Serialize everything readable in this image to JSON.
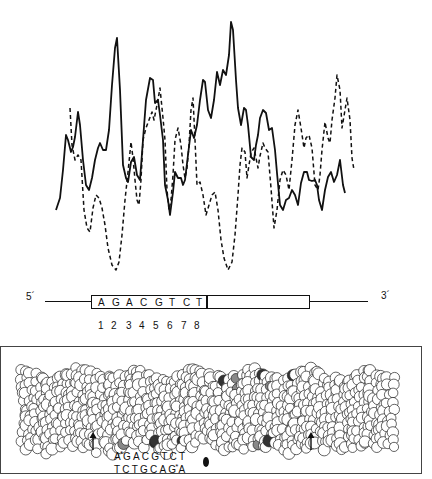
{
  "figure": {
    "profile_plot": {
      "series": [
        {
          "name": "solid-profile",
          "style": "solid"
        },
        {
          "name": "dashed-profile",
          "style": "dashed"
        }
      ]
    },
    "sequence_map": {
      "five_prime_label": "5´",
      "three_prime_label": "3´",
      "sequence": [
        "A",
        "G",
        "A",
        "C",
        "G",
        "T",
        "C",
        "T"
      ],
      "positions": [
        "1",
        "2",
        "3",
        "4",
        "5",
        "6",
        "7",
        "8"
      ]
    },
    "model_panel": {
      "top_strand": "A*GACGTCT",
      "bottom_strand": "TCTGCAG*A",
      "top_strand_parts": {
        "first": "A",
        "star": "*",
        "rest": "GACGTCT"
      },
      "bottom_strand_parts": {
        "first": "TCTGCAG",
        "star": "*",
        "rest": "A"
      },
      "arrow_count": 2
    }
  },
  "chart_data": {
    "type": "line",
    "title": "",
    "xlabel": "",
    "ylabel": "",
    "grid": false,
    "legend": "none",
    "note": "Unlabeled profile curves (no axes/ticks shown); values are relative heights 0-100 estimated from the image, x = relative position 0-100 along the sequence.",
    "series": [
      {
        "name": "solid",
        "x": [
          0,
          3,
          5,
          7,
          9,
          10,
          12,
          14,
          16,
          18,
          20,
          22,
          24,
          26,
          28,
          30,
          32,
          34,
          36,
          38,
          40,
          42,
          44,
          46,
          48,
          50,
          52,
          54,
          56,
          58,
          60,
          62,
          64,
          66,
          68,
          70,
          72,
          74,
          76,
          78,
          80,
          82,
          84,
          86,
          88,
          90,
          92,
          94,
          96
        ],
        "values": [
          22,
          45,
          52,
          46,
          56,
          42,
          30,
          36,
          46,
          48,
          56,
          88,
          84,
          40,
          50,
          34,
          50,
          74,
          70,
          50,
          28,
          36,
          34,
          42,
          58,
          48,
          70,
          57,
          76,
          74,
          96,
          58,
          60,
          44,
          52,
          62,
          56,
          50,
          30,
          26,
          30,
          28,
          38,
          34,
          32,
          26,
          36,
          34,
          30
        ]
      },
      {
        "name": "dashed",
        "x": [
          0,
          3,
          5,
          7,
          9,
          11,
          13,
          15,
          17,
          19,
          21,
          23,
          25,
          27,
          29,
          31,
          33,
          35,
          37,
          39,
          41,
          43,
          45,
          47,
          49,
          51,
          53,
          55,
          57,
          59,
          61,
          63,
          65,
          67,
          69,
          71,
          73,
          75,
          77,
          79,
          81,
          83,
          85,
          87,
          89,
          91,
          93,
          95,
          97
        ],
        "values": [
          null,
          null,
          62,
          40,
          36,
          18,
          12,
          24,
          30,
          14,
          5,
          22,
          46,
          30,
          56,
          64,
          62,
          40,
          48,
          36,
          60,
          32,
          20,
          28,
          16,
          30,
          5,
          20,
          38,
          36,
          42,
          34,
          44,
          22,
          14,
          34,
          40,
          30,
          52,
          40,
          44,
          28,
          46,
          44,
          60,
          50,
          58,
          44,
          66
        ]
      }
    ]
  }
}
